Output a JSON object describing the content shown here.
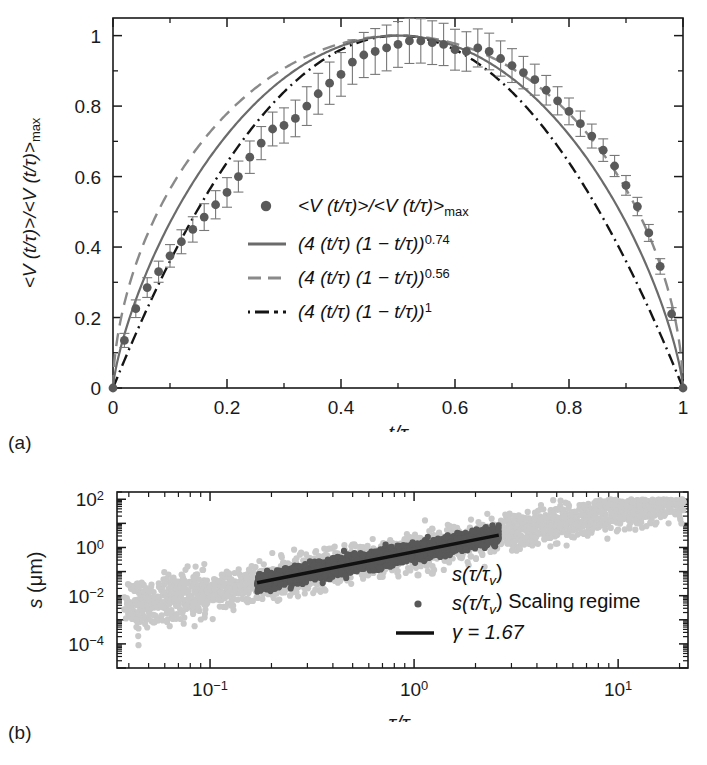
{
  "figure": {
    "panel_a_label": "(a)",
    "panel_b_label": "(b)"
  },
  "panel_a": {
    "xlabel": "t/τ",
    "ylabel": "<V (t/τ)>/<V (t/τ)>max",
    "ylabel_base": "<V (t/τ)>/<V (t/τ)>",
    "ylabel_sub": "max",
    "xticks": [
      "0",
      "0.2",
      "0.4",
      "0.6",
      "0.8",
      "1"
    ],
    "yticks": [
      "0",
      "0.2",
      "0.4",
      "0.6",
      "0.8",
      "1"
    ],
    "legend": [
      {
        "marker": "circle",
        "base": "<V (t/τ)>/<V (t/τ)>",
        "sub": "max",
        "exp": ""
      },
      {
        "marker": "solid-line",
        "base": "(4 (t/τ) (1 − t/τ))",
        "sub": "",
        "exp": "0.74"
      },
      {
        "marker": "dashed-line",
        "base": "(4 (t/τ) (1 − t/τ))",
        "sub": "",
        "exp": "0.56"
      },
      {
        "marker": "dashdot-line",
        "base": "(4 (t/τ) (1 − t/τ))",
        "sub": "",
        "exp": "1"
      }
    ],
    "colors": {
      "marker": "#5a5a5a",
      "solid": "#6b6b6b",
      "dashed": "#8a8a8a",
      "dashdot": "#151515",
      "axis": "#1a1a1a"
    }
  },
  "panel_b": {
    "xlabel_base": "τ/τ",
    "xlabel_sub": "v",
    "ylabel": "s (μm)",
    "xticks": [
      {
        "base": "10",
        "exp": "−1"
      },
      {
        "base": "10",
        "exp": "0"
      },
      {
        "base": "10",
        "exp": "1"
      }
    ],
    "yticks": [
      {
        "base": "10",
        "exp": "2"
      },
      {
        "base": "10",
        "exp": "0"
      },
      {
        "base": "10",
        "exp": "−2"
      },
      {
        "base": "10",
        "exp": "−4"
      }
    ],
    "legend": [
      {
        "marker": "light-dot",
        "base": "s(τ/τ",
        "sub": "v",
        "tail": ")"
      },
      {
        "marker": "dark-dot",
        "base": "s(τ/τ",
        "sub": "v",
        "tail": ") Scaling regime"
      },
      {
        "marker": "solid-line",
        "base": "γ = 1.67",
        "sub": "",
        "tail": ""
      }
    ],
    "colors": {
      "light_points": "#c9c9c9",
      "dark_points": "#585858",
      "fit_line": "#111111",
      "axis": "#1a1a1a"
    }
  },
  "chart_data": [
    {
      "type": "line",
      "panel": "a",
      "title": "",
      "xlabel": "t/τ",
      "ylabel": "<V (t/τ)>/<V (t/τ)>max",
      "xlim": [
        0,
        1
      ],
      "ylim": [
        0,
        1.05
      ],
      "grid": false,
      "legend_position": "center",
      "series": [
        {
          "name": "<V (t/τ)>/<V (t/τ)>max",
          "style": "markers-with-errorbars",
          "color": "#5a5a5a",
          "x": [
            0.0,
            0.02,
            0.04,
            0.06,
            0.08,
            0.1,
            0.12,
            0.14,
            0.16,
            0.18,
            0.2,
            0.22,
            0.24,
            0.26,
            0.28,
            0.3,
            0.32,
            0.34,
            0.36,
            0.38,
            0.4,
            0.42,
            0.44,
            0.46,
            0.48,
            0.5,
            0.52,
            0.54,
            0.56,
            0.58,
            0.6,
            0.62,
            0.64,
            0.66,
            0.68,
            0.7,
            0.72,
            0.74,
            0.76,
            0.78,
            0.8,
            0.82,
            0.84,
            0.86,
            0.88,
            0.9,
            0.92,
            0.94,
            0.96,
            0.98,
            1.0
          ],
          "y": [
            0.0,
            0.135,
            0.225,
            0.285,
            0.33,
            0.375,
            0.415,
            0.45,
            0.485,
            0.52,
            0.555,
            0.6,
            0.655,
            0.695,
            0.735,
            0.745,
            0.765,
            0.8,
            0.835,
            0.865,
            0.89,
            0.925,
            0.945,
            0.955,
            0.965,
            0.975,
            0.985,
            0.985,
            0.98,
            0.975,
            0.96,
            0.955,
            0.965,
            0.955,
            0.935,
            0.915,
            0.895,
            0.875,
            0.845,
            0.815,
            0.785,
            0.75,
            0.715,
            0.675,
            0.63,
            0.575,
            0.515,
            0.44,
            0.345,
            0.21,
            0.0
          ],
          "yerr": [
            0.0,
            0.02,
            0.025,
            0.028,
            0.03,
            0.032,
            0.034,
            0.036,
            0.038,
            0.04,
            0.042,
            0.044,
            0.046,
            0.047,
            0.048,
            0.05,
            0.052,
            0.055,
            0.058,
            0.06,
            0.062,
            0.063,
            0.064,
            0.065,
            0.065,
            0.065,
            0.064,
            0.063,
            0.062,
            0.06,
            0.058,
            0.056,
            0.054,
            0.052,
            0.05,
            0.048,
            0.046,
            0.044,
            0.042,
            0.04,
            0.038,
            0.036,
            0.034,
            0.032,
            0.03,
            0.028,
            0.026,
            0.024,
            0.022,
            0.018,
            0.0
          ]
        },
        {
          "name": "(4 (t/τ) (1 − t/τ))^0.74",
          "style": "solid",
          "color": "#6b6b6b",
          "exponent": 0.74,
          "formula": "(4*x*(1-x))^0.74"
        },
        {
          "name": "(4 (t/τ) (1 − t/τ))^0.56",
          "style": "dashed",
          "color": "#8a8a8a",
          "exponent": 0.56,
          "formula": "(4*x*(1-x))^0.56"
        },
        {
          "name": "(4 (t/τ) (1 − t/τ))^1",
          "style": "dashdot",
          "color": "#151515",
          "exponent": 1,
          "formula": "(4*x*(1-x))^1"
        }
      ]
    },
    {
      "type": "scatter",
      "panel": "b",
      "title": "",
      "xlabel": "τ/τv",
      "ylabel": "s (μm)",
      "xscale": "log",
      "yscale": "log",
      "xlim": [
        0.035,
        22
      ],
      "ylim": [
        1e-05,
        200
      ],
      "grid": false,
      "legend_position": "lower-right",
      "series": [
        {
          "name": "s(τ/τv)",
          "style": "points",
          "color": "#c9c9c9",
          "n_points": 2600,
          "x_range": [
            0.038,
            21
          ],
          "slope_gamma": 1.67,
          "intercept_log10": -0.18,
          "scatter_sigma_log10": 0.75
        },
        {
          "name": "s(τ/τv) Scaling regime",
          "style": "points",
          "color": "#585858",
          "n_points": 2200,
          "x_range": [
            0.17,
            2.6
          ],
          "slope_gamma": 1.67,
          "intercept_log10": -0.18,
          "scatter_sigma_log10": 0.42
        },
        {
          "name": "γ = 1.67",
          "style": "solid-line",
          "color": "#111111",
          "gamma": 1.67,
          "x_range": [
            0.17,
            2.6
          ],
          "intercept_log10": -0.18
        }
      ]
    }
  ]
}
